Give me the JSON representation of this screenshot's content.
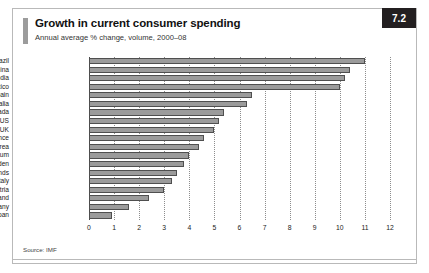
{
  "figure": {
    "badge": "7.2",
    "title": "Growth in current consumer spending",
    "subtitle": "Annual average % change, volume, 2000–08",
    "source": "Source: IMF"
  },
  "chart_data": {
    "type": "bar",
    "orientation": "horizontal",
    "title": "Growth in current consumer spending",
    "subtitle": "Annual average % change, volume, 2000–08",
    "xlabel": "",
    "ylabel": "",
    "xlim": [
      0,
      12
    ],
    "xticks": [
      "0",
      "1",
      "2",
      "3",
      "4",
      "5",
      "6",
      "7",
      "8",
      "9",
      "10",
      "11",
      "12"
    ],
    "grid": "vertical dotted gridlines at each integer tick",
    "legend": "none",
    "source": "Source: IMF",
    "categories": [
      "Brazil",
      "China",
      "India",
      "Mexico",
      "Spain",
      "Australia",
      "Canada",
      "US",
      "UK",
      "France",
      "Euro area",
      "Belgium",
      "Sweden",
      "Netherlands",
      "Italy",
      "Austria",
      "Switzerland",
      "Germany",
      "Japan"
    ],
    "values": [
      11.0,
      10.4,
      10.2,
      10.0,
      6.5,
      6.3,
      5.4,
      5.2,
      5.0,
      4.6,
      4.4,
      4.0,
      3.8,
      3.5,
      3.3,
      3.0,
      2.4,
      1.6,
      0.9
    ],
    "units": "%"
  }
}
